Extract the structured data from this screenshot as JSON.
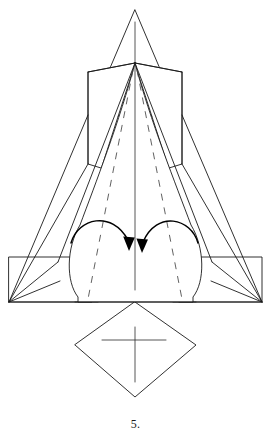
{
  "document": {
    "kind": "origami-folding-diagram",
    "caption": "5.",
    "caption_position": {
      "x": 135,
      "y": 424
    },
    "background_color": "#ffffff",
    "line_color": "#1a1a1a",
    "dashed_line_color": "#444444",
    "arrow_color": "#000000",
    "canvas": {
      "width": 271,
      "height": 438
    }
  },
  "figure": {
    "key_points": {
      "apex_top": {
        "x": 135,
        "y": 10
      },
      "collar_vertex": {
        "x": 135,
        "y": 63
      },
      "left_shoulder_top": {
        "x": 88,
        "y": 115
      },
      "right_shoulder_top": {
        "x": 182,
        "y": 115
      },
      "left_shoulder_bottom": {
        "x": 88,
        "y": 164
      },
      "right_shoulder_bottom": {
        "x": 182,
        "y": 164
      },
      "baseline_y": 302,
      "left_wing_outer": {
        "x": 9,
        "y": 302
      },
      "right_wing_outer": {
        "x": 262,
        "y": 302
      },
      "wing_top_y": 257,
      "diamond_bottom": {
        "x": 135,
        "y": 397
      },
      "diamond_left": {
        "x": 75,
        "y": 345
      },
      "diamond_right": {
        "x": 196,
        "y": 345
      }
    },
    "shapes": [
      {
        "name": "nose-cone",
        "type": "triangle",
        "description": "tall narrow triangle at top"
      },
      {
        "name": "left-shoulder-flap",
        "type": "polygon",
        "description": "angled flap on the left of the collar"
      },
      {
        "name": "right-shoulder-flap",
        "type": "polygon",
        "description": "angled flap on the right of the collar"
      },
      {
        "name": "body-panel",
        "type": "polygon",
        "description": "large central body with rounded lower lobes"
      },
      {
        "name": "left-wing-rectangle",
        "type": "rectangle",
        "description": "horizontal rectangle wing on the left"
      },
      {
        "name": "right-wing-rectangle",
        "type": "rectangle",
        "description": "horizontal rectangle wing on the right"
      },
      {
        "name": "bottom-diamond",
        "type": "diamond",
        "description": "square rotated 45 degrees below the baseline"
      },
      {
        "name": "center-crease",
        "type": "line",
        "description": "vertical centre fold line"
      },
      {
        "name": "cross-mark",
        "type": "cross",
        "description": "plus sign inside the bottom diamond"
      }
    ],
    "fold_lines": [
      {
        "name": "left-valley-crease",
        "style": "dashed",
        "from": {
          "x": 135,
          "y": 63
        },
        "to": {
          "x": 88,
          "y": 299
        }
      },
      {
        "name": "right-valley-crease",
        "style": "dashed",
        "from": {
          "x": 135,
          "y": 63
        },
        "to": {
          "x": 182,
          "y": 299
        }
      }
    ],
    "arrows": [
      {
        "name": "left-fold-arrow",
        "direction": "clockwise-inward",
        "start": {
          "x": 71,
          "y": 243
        },
        "end": {
          "x": 129,
          "y": 251
        },
        "peak": {
          "x": 100,
          "y": 222
        }
      },
      {
        "name": "right-fold-arrow",
        "direction": "counter-clockwise-inward",
        "start": {
          "x": 198,
          "y": 243
        },
        "end": {
          "x": 142,
          "y": 253
        },
        "peak": {
          "x": 170,
          "y": 222
        }
      }
    ]
  }
}
